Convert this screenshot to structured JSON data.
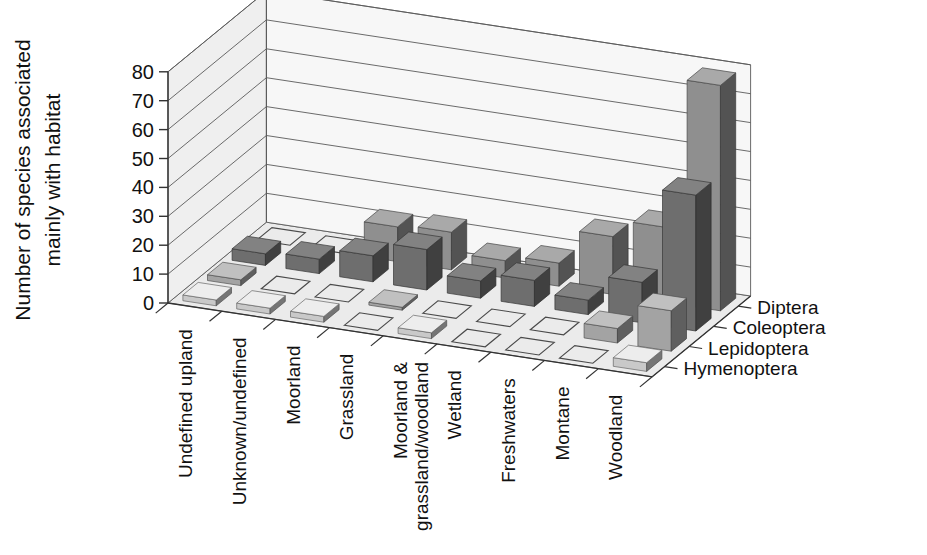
{
  "axes": {
    "y_title_line1": "Number of species associated",
    "y_title_line2": "mainly with habitat",
    "y_ticks": [
      "0",
      "10",
      "20",
      "30",
      "40",
      "50",
      "60",
      "70",
      "80"
    ]
  },
  "colors": {
    "background": "#ffffff",
    "back_wall": "#f7f7f7",
    "side_wall": "#efefef",
    "floor": "#ebebeb",
    "gridline": "#5a5a5a",
    "axis_line": "#333333",
    "series_diptera": "#8f8f8f",
    "series_coleoptera": "#6e6e6e",
    "series_lepidoptera": "#a3a3a3",
    "series_hymenoptera": "#c9c9c9",
    "empty_outline": "#4a4a4a"
  },
  "chart_data": {
    "type": "bar",
    "title": "",
    "subtitle": "",
    "xlabel": "",
    "ylabel": "Number of species associated mainly with habitat",
    "zlabel": "",
    "ylim": [
      0,
      80
    ],
    "grid": true,
    "legend_position": "right-depth-axis",
    "projection": "3d",
    "categories": [
      "Undefined upland",
      "Unknown/undefined",
      "Moorland",
      "Grassland",
      "Moorland & grassland/woodland",
      "Wetland",
      "Freshwaters",
      "Montane",
      "Woodland"
    ],
    "series": [
      {
        "name": "Diptera",
        "values": [
          0,
          0,
          12,
          13,
          6,
          8,
          20,
          26,
          78
        ]
      },
      {
        "name": "Coleoptera",
        "values": [
          4,
          5,
          9,
          14,
          6,
          9,
          5,
          14,
          47
        ]
      },
      {
        "name": "Lepidoptera",
        "values": [
          2,
          0,
          0,
          1,
          0,
          0,
          0,
          5,
          14
        ]
      },
      {
        "name": "Hymenoptera",
        "values": [
          2,
          2,
          2,
          0,
          2,
          0,
          0,
          0,
          3
        ]
      }
    ]
  }
}
